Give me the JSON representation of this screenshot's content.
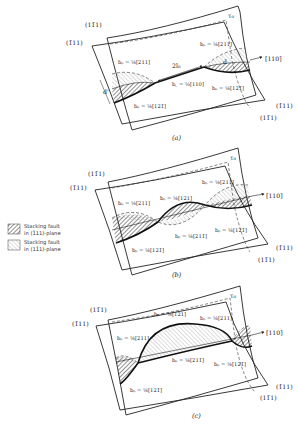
{
  "figure": {
    "legend": [
      {
        "label_line1": "Stacking fault",
        "label_line2": "in (1̄11)-plane",
        "pattern": "hatch-dense"
      },
      {
        "label_line1": "Stacking fault",
        "label_line2": "in (11̄1)-plane",
        "pattern": "hatch-light"
      }
    ],
    "panels": [
      {
        "caption": "(a)",
        "plane_upper": "(11̄1)",
        "plane_lower_left": "(1̄11)",
        "plane_right_1": "(1̄11)",
        "plane_right_2": "(11̄1)",
        "direction": "[110]",
        "stress": "τ₀",
        "spacing": "2l₀",
        "width_left": "d'",
        "width_right": "d",
        "labels": [
          "bₚ = ⅙[211]",
          "bₚ = ⅙[121̄]",
          "b꜀ = ½[110]",
          "bₚ = ⅙[211]",
          "bₚ = ⅙[121̄]"
        ]
      },
      {
        "caption": "(b)",
        "plane_upper": "(11̄1)",
        "plane_lower_left": "(1̄11)",
        "plane_right_1": "(1̄11)",
        "plane_right_2": "(11̄1)",
        "direction": "[110]",
        "stress": "τ₀",
        "labels": [
          "bₚ = ⅙[211]",
          "bₚ = ⅙[121]",
          "bₚ = ⅙[211]",
          "bₚ = ⅙[121̄]",
          "bₚ = ⅙[211̄]",
          "bₚ = ⅙[121̄]"
        ]
      },
      {
        "caption": "(c)",
        "plane_upper": "(11̄1)",
        "plane_lower_left": "(1̄11)",
        "plane_right_1": "(1̄11)",
        "plane_right_2": "(11̄1)",
        "direction": "[110]",
        "stress": "τ₀",
        "labels": [
          "bₚ = ⅙[211]",
          "bₚ = ⅙[121]",
          "bₚ = ⅙[211]",
          "bₚ = ⅙[211̄]",
          "bₚ = ⅙[121̄]",
          "bₚ = ⅙[121̄]"
        ]
      }
    ]
  }
}
